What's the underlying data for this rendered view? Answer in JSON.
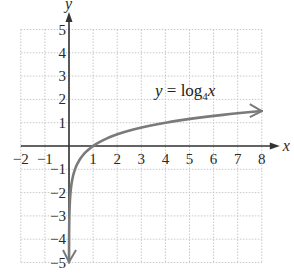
{
  "chart_data": {
    "type": "line",
    "title": "",
    "annotation": {
      "lhs": "y",
      "eq": " = log",
      "sub": "4",
      "var": "x"
    },
    "xlabel": "x",
    "ylabel": "y",
    "xlim": [
      -2,
      8
    ],
    "ylim": [
      -5,
      5
    ],
    "xticks": [
      -2,
      -1,
      1,
      2,
      3,
      4,
      5,
      6,
      7,
      8
    ],
    "xtick_labels": [
      "−2",
      "−1",
      "1",
      "2",
      "3",
      "4",
      "5",
      "6",
      "7",
      "8"
    ],
    "yticks": [
      5,
      4,
      3,
      2,
      1,
      -1,
      -2,
      -3,
      -4,
      -5
    ],
    "ytick_labels": [
      "5",
      "4",
      "3",
      "2",
      "1",
      "−1",
      "−2",
      "−3",
      "−4",
      "−5"
    ],
    "grid": true,
    "series": [
      {
        "name": "y = log4 x",
        "function": "log4(x)",
        "color": "#7a7a7a",
        "x": [
          0.001,
          0.002,
          0.004,
          0.008,
          0.016,
          0.0625,
          0.125,
          0.25,
          0.5,
          1,
          2,
          4,
          8
        ],
        "values": [
          -4.98,
          -4.48,
          -3.98,
          -3.48,
          -2.98,
          -2,
          -1.5,
          -1,
          -0.5,
          0,
          0.5,
          1,
          1.5
        ],
        "arrows": [
          "down-end",
          "right-end"
        ]
      }
    ],
    "key_points": [
      {
        "x": 0.25,
        "y": -1
      },
      {
        "x": 1,
        "y": 0
      },
      {
        "x": 4,
        "y": 1
      }
    ]
  },
  "colors": {
    "axis": "#333333",
    "grid": "#c8c8c8",
    "curve": "#7a7a7a"
  }
}
